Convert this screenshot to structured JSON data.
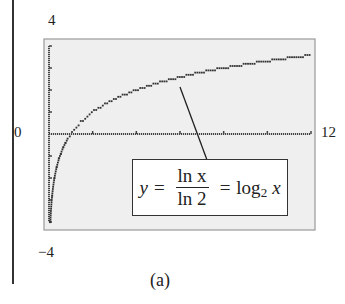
{
  "chart_data": {
    "type": "line",
    "title": "",
    "xlabel": "",
    "ylabel": "",
    "xlim": [
      0,
      12
    ],
    "ylim": [
      -4,
      4
    ],
    "x_tick_labels": {
      "left": "0",
      "right": "12"
    },
    "y_tick_labels": {
      "top": "4",
      "bottom": "-4"
    },
    "x_ticks": [
      0,
      2,
      4,
      6,
      8,
      10,
      12
    ],
    "y_ticks": [
      -4,
      -3,
      -2,
      -1,
      0,
      1,
      2,
      3,
      4
    ],
    "grid": false,
    "legend_position": "none",
    "background_color": "#efefef",
    "series": [
      {
        "name": "y = ln x / ln 2 = log2 x",
        "style": "dotted",
        "color": "#333333",
        "x": [
          0.1,
          0.25,
          0.5,
          0.75,
          1,
          1.5,
          2,
          3,
          4,
          5,
          6,
          7,
          8,
          9,
          10,
          11,
          12
        ],
        "values": [
          -3.32,
          -2.0,
          -1.0,
          -0.42,
          0,
          0.58,
          1.0,
          1.58,
          2.0,
          2.32,
          2.58,
          2.81,
          3.0,
          3.17,
          3.32,
          3.46,
          3.58
        ]
      }
    ],
    "annotations": [
      {
        "text": "y = ln x / ln 2 = log2 x",
        "points_to_x": 5.3,
        "points_to_y": 2.4
      }
    ]
  },
  "labels": {
    "y_top": "4",
    "y_bottom": "−4",
    "x_left": "0",
    "x_right": "12",
    "caption": "(a)"
  },
  "equation": {
    "lhs": "y",
    "eq1": "=",
    "num": "ln x",
    "den": "ln 2",
    "eq2": "=",
    "log": "log",
    "base": "2",
    "arg": "x"
  }
}
